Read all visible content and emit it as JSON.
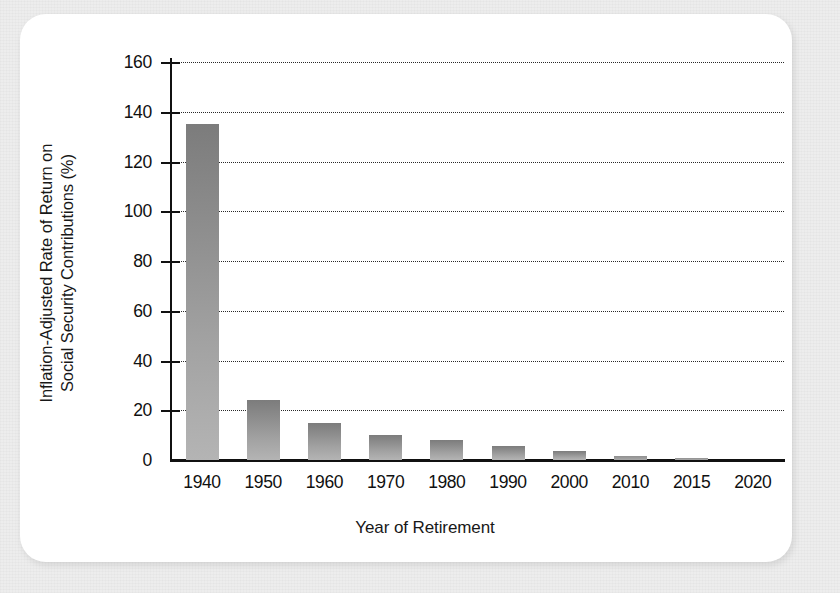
{
  "figure": {
    "background_color": "#ededed",
    "card_color": "#ffffff",
    "bar_color_top": "#7c7c7c",
    "bar_color_bottom": "#b4b4b4",
    "axis_color": "#111111",
    "gridline_color": "#2a2a2a"
  },
  "chart_data": {
    "type": "bar",
    "title": "",
    "xlabel": "Year of Retirement",
    "ylabel": "Inflation-Adjusted Rate of Return on\nSocial Security Contributions (%)",
    "categories": [
      "1940",
      "1950",
      "1960",
      "1970",
      "1980",
      "1990",
      "2000",
      "2010",
      "2015",
      "2020"
    ],
    "values": [
      135,
      24,
      15,
      10,
      8,
      5.5,
      3.5,
      1.5,
      0.7,
      0
    ],
    "ylim": [
      0,
      160
    ],
    "yticks": [
      0,
      20,
      40,
      60,
      80,
      100,
      120,
      140,
      160
    ],
    "ytick_labels": [
      "0",
      "20",
      "40",
      "60",
      "80",
      "100",
      "120",
      "140",
      "160"
    ],
    "grid": true,
    "grid_style": "dotted",
    "grid_axis": "y",
    "legend": false,
    "legend_position": "none",
    "series": [
      {
        "name": "Inflation-Adjusted Rate of Return on Social Security Contributions",
        "values": [
          135,
          24,
          15,
          10,
          8,
          5.5,
          3.5,
          1.5,
          0.7,
          0
        ]
      }
    ]
  }
}
